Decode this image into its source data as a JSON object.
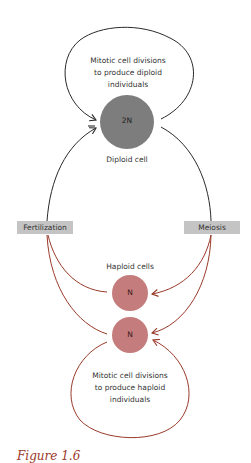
{
  "diagram": {
    "top_loop_text": [
      "Mitotic cell divisions",
      "to produce diploid",
      "individuals"
    ],
    "diploid_cell": {
      "symbol": "2N",
      "label": "Diploid cell",
      "color": "#7d7d7d"
    },
    "fertilization_label": "Fertilization",
    "meiosis_label": "Meiosis",
    "haploid_cells": {
      "label": "Haploid cells",
      "symbols": [
        "N",
        "N"
      ],
      "color": "#c47c7c"
    },
    "bottom_loop_text": [
      "Mitotic cell divisions",
      "to produce haploid",
      "individuals"
    ],
    "colors": {
      "diploid_arrows": "#2a2a2a",
      "haploid_arrows": "#9a3a2a",
      "label_box": "#c4c4c4"
    },
    "caption_fragment": "Figure 1.6"
  }
}
